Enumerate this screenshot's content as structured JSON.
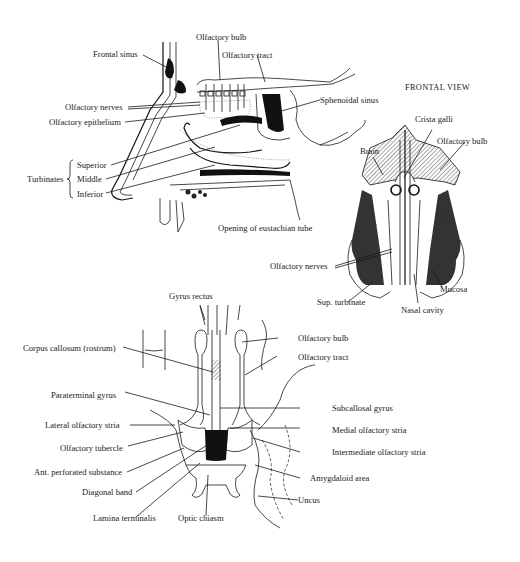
{
  "figure": {
    "sagittal_view": {
      "labels": {
        "frontal_sinus": "Frontal sinus",
        "olfactory_bulb": "Olfactory bulb",
        "olfactory_tract": "Olfactory tract",
        "sphenoidal_sinus": "Sphenoidal sinus",
        "olfactory_nerves": "Olfactory nerves",
        "olfactory_epithelium": "Olfactory epithelium",
        "turbinates": "Turbinates",
        "superior": "Superior",
        "middle": "Middle",
        "inferior": "Inferior",
        "eustachian": "Opening of eustachian tube"
      }
    },
    "frontal_view": {
      "title": "FRONTAL VIEW",
      "labels": {
        "crista_galli": "Crista galli",
        "brain": "Brain",
        "olfactory_bulb": "Olfactory bulb",
        "olfactory_nerves": "Olfactory nerves",
        "sup_turbinate": "Sup. turbinate",
        "mucosa": "Mucosa",
        "nasal_cavity": "Nasal cavity"
      }
    },
    "basal_view": {
      "labels": {
        "gyrus_rectus": "Gyrus rectus",
        "corpus_callosum": "Corpus callosum (rostrum)",
        "olfactory_bulb": "Olfactory bulb",
        "olfactory_tract": "Olfactory tract",
        "paraterminal_gyrus": "Paraterminal gyrus",
        "subcallosal_gyrus": "Subcallosal gyrus",
        "lateral_stria": "Lateral olfactory stria",
        "medial_stria": "Medial olfactory stria",
        "olfactory_tubercle": "Olfactory tubercle",
        "intermediate_stria": "Intermediate olfactory stria",
        "ant_perforated": "Ant. perforated substance",
        "amygdaloid": "Amygdaloid area",
        "diagonal_band": "Diagonal band",
        "uncus": "Uncus",
        "lamina_terminalis": "Lamina terminalis",
        "optic_chiasm": "Optic chiasm"
      }
    }
  }
}
